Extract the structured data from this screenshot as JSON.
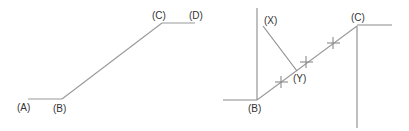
{
  "figures": [
    {
      "id": "left",
      "labels": {
        "A": "(A)",
        "B": "(B)",
        "C": "(C)",
        "D": "(D)"
      }
    },
    {
      "id": "right",
      "labels": {
        "B": "(B)",
        "C": "(C)",
        "X": "(X)",
        "Y": "(Y)"
      }
    }
  ],
  "colors": {
    "line": "#9a9a9a",
    "text": "#333333",
    "background": "#ffffff"
  }
}
